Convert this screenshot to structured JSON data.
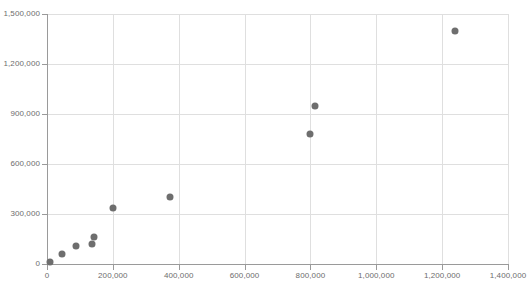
{
  "chart_data": {
    "type": "scatter",
    "title": "",
    "subtitle": "",
    "xlabel": "",
    "ylabel": "",
    "xlim": [
      0,
      1400000
    ],
    "ylim": [
      0,
      1500000
    ],
    "grid": true,
    "legend": null,
    "marker_color": "#6e6e6e",
    "gridline_color": "#dfdfdf",
    "axis_color": "#9a9a9a",
    "tick_label_color": "#6d6d6d",
    "background_color": "#ffffff",
    "x_ticks": [
      0,
      200000,
      400000,
      600000,
      800000,
      1000000,
      1200000,
      1400000
    ],
    "y_ticks": [
      0,
      300000,
      600000,
      900000,
      1200000,
      1500000
    ],
    "x_tick_labels": [
      "0",
      "200,000",
      "400,000",
      "600,000",
      "800,000",
      "1,000,000",
      "1,200,000",
      "1,400,000"
    ],
    "y_tick_labels": [
      "0",
      "300,000",
      "600,000",
      "900,000",
      "1,200,000",
      "1,500,000"
    ],
    "series": [
      {
        "name": "series-1",
        "points": [
          {
            "x": 8000,
            "y": 12000
          },
          {
            "x": 45000,
            "y": 60000
          },
          {
            "x": 88000,
            "y": 110000
          },
          {
            "x": 136000,
            "y": 120000
          },
          {
            "x": 143000,
            "y": 160000
          },
          {
            "x": 200000,
            "y": 335000
          },
          {
            "x": 375000,
            "y": 400000
          },
          {
            "x": 800000,
            "y": 780000
          },
          {
            "x": 815000,
            "y": 950000
          },
          {
            "x": 1240000,
            "y": 1400000
          }
        ]
      }
    ]
  }
}
